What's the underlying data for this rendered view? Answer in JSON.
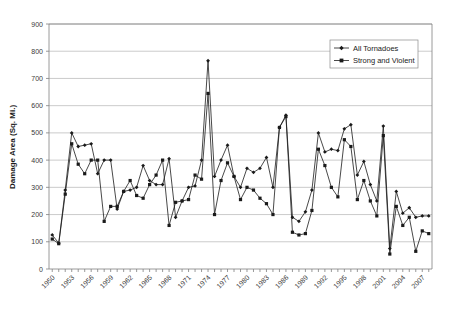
{
  "chart_data": {
    "type": "line",
    "title": "",
    "xlabel": "",
    "ylabel": "Damage Area (Sq. Mi.)",
    "ylim": [
      0,
      900
    ],
    "ytick_step": 100,
    "yticks": [
      0,
      100,
      200,
      300,
      400,
      500,
      600,
      700,
      800,
      900
    ],
    "grid": true,
    "legend_position": "top-right",
    "x": [
      1950,
      1951,
      1952,
      1953,
      1954,
      1955,
      1956,
      1957,
      1958,
      1959,
      1960,
      1961,
      1962,
      1963,
      1964,
      1965,
      1966,
      1967,
      1968,
      1969,
      1970,
      1971,
      1972,
      1973,
      1974,
      1975,
      1976,
      1977,
      1978,
      1979,
      1980,
      1981,
      1982,
      1983,
      1984,
      1985,
      1986,
      1987,
      1988,
      1989,
      1990,
      1991,
      1992,
      1993,
      1994,
      1995,
      1996,
      1997,
      1998,
      1999,
      2000,
      2001,
      2002,
      2003,
      2004,
      2005,
      2006,
      2007,
      2008
    ],
    "xtick_labels": [
      "1950",
      "1953",
      "1956",
      "1959",
      "1962",
      "1965",
      "1968",
      "1971",
      "1974",
      "1977",
      "1980",
      "1983",
      "1986",
      "1989",
      "1992",
      "1995",
      "1998",
      "2001",
      "2004"
    ],
    "xtick_interval": 3,
    "series": [
      {
        "name": "All Tornadoes",
        "marker": "diamond",
        "color": "#1a1a1a",
        "values": [
          125,
          95,
          290,
          500,
          450,
          455,
          460,
          350,
          400,
          400,
          220,
          285,
          290,
          300,
          380,
          325,
          310,
          310,
          405,
          190,
          250,
          300,
          305,
          400,
          765,
          340,
          400,
          455,
          340,
          300,
          370,
          355,
          370,
          410,
          300,
          520,
          565,
          190,
          175,
          210,
          290,
          500,
          430,
          440,
          435,
          515,
          530,
          345,
          395,
          310,
          250,
          525,
          75,
          285,
          205,
          225,
          190,
          195,
          195
        ]
      },
      {
        "name": "Strong and Violent",
        "marker": "square",
        "color": "#1a1a1a",
        "values": [
          110,
          93,
          275,
          460,
          385,
          350,
          400,
          400,
          175,
          230,
          230,
          285,
          325,
          270,
          260,
          310,
          345,
          400,
          160,
          245,
          250,
          255,
          345,
          330,
          645,
          200,
          325,
          390,
          340,
          255,
          300,
          290,
          260,
          240,
          200,
          520,
          560,
          135,
          125,
          130,
          215,
          440,
          380,
          300,
          265,
          475,
          450,
          255,
          325,
          250,
          195,
          490,
          55,
          230,
          160,
          190,
          65,
          140,
          130
        ]
      }
    ]
  },
  "legend": {
    "items": [
      {
        "label": "All Tornadoes"
      },
      {
        "label": "Strong and Violent"
      }
    ]
  }
}
